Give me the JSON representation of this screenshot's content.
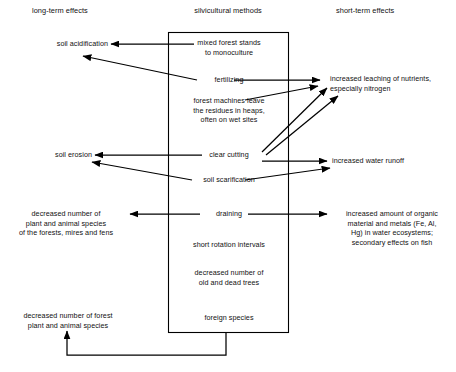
{
  "diagram": {
    "title_columns": {
      "left": "long-term effects",
      "center": "silvicultural methods",
      "right": "short-term effects"
    },
    "center_box": {
      "items": [
        {
          "id": "mixed-forest-stands",
          "label": "mixed forest stands\nto monoculture"
        },
        {
          "id": "fertilizing",
          "label": "fertilizing"
        },
        {
          "id": "forest-machines",
          "label": "forest machines leave\nthe residues in heaps,\noften on wet sites"
        },
        {
          "id": "clear-cutting",
          "label": "clear cutting"
        },
        {
          "id": "soil-scarification",
          "label": "soil scarification"
        },
        {
          "id": "draining",
          "label": "draining"
        },
        {
          "id": "short-rotation-intervals",
          "label": "short rotation intervals"
        },
        {
          "id": "decreased-old-dead-trees",
          "label": "decreased number of\nold and dead trees"
        },
        {
          "id": "foreign-species",
          "label": "foreign species"
        }
      ]
    },
    "left_effects": [
      {
        "id": "soil-acidification",
        "label": "soil acidification"
      },
      {
        "id": "soil-erosion",
        "label": "soil erosion"
      },
      {
        "id": "decreased-species-forests-mires-fens",
        "label": "decreased number of\nplant and animal species\nof the forests, mires and fens"
      },
      {
        "id": "decreased-forest-species",
        "label": "decreased number of forest\nplant and animal species"
      }
    ],
    "right_effects": [
      {
        "id": "increased-leaching-nutrients",
        "label": "increased leaching of nutrients,\nespecially nitrogen"
      },
      {
        "id": "increased-water-runoff",
        "label": "increased water runoff"
      },
      {
        "id": "increased-organic-material-metals",
        "label": "increased amount of organic\nmaterial and metals (Fe, Al,\nHg) in water ecosystems;\nsecondary effects on fish"
      }
    ],
    "colors": {
      "ink": "#000000",
      "background": "#ffffff"
    }
  }
}
